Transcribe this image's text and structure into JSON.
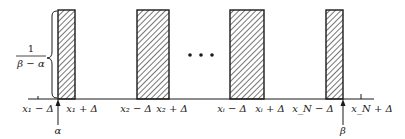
{
  "diagram": {
    "height_label": {
      "numerator": "1",
      "denominator": "β − α"
    },
    "ellipsis": "• • •",
    "rectangles": [
      {
        "name": "pulse-1",
        "x": 58,
        "width": 17
      },
      {
        "name": "pulse-2",
        "x": 137,
        "width": 32
      },
      {
        "name": "pulse-i",
        "x": 230,
        "width": 34
      },
      {
        "name": "pulse-N",
        "x": 326,
        "width": 17
      }
    ],
    "axis_labels": [
      {
        "text": "x₁ − Δ",
        "x": 38
      },
      {
        "text": "x₁ + Δ",
        "x": 80
      },
      {
        "text": "x₂ − Δ",
        "x": 118
      },
      {
        "text": "x₂ + Δ",
        "x": 158
      },
      {
        "text": "xᵢ − Δ",
        "x": 217
      },
      {
        "text": "xᵢ + Δ",
        "x": 257
      },
      {
        "text": "x_N − Δ",
        "x": 293
      },
      {
        "text": "x_N + Δ",
        "x": 357
      }
    ],
    "markers": [
      {
        "symbol": "α",
        "x": 58
      },
      {
        "symbol": "β",
        "x": 343
      }
    ],
    "colors": {
      "ink": "#1a1a1a",
      "background": "#ffffff"
    }
  }
}
